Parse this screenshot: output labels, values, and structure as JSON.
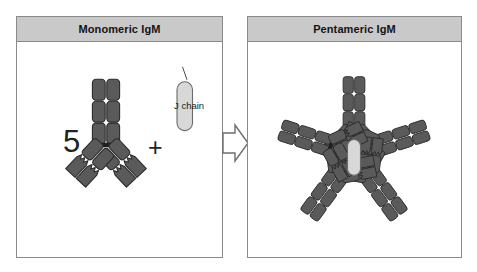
{
  "figure": {
    "background_color": "#ffffff"
  },
  "colors": {
    "panel_border": "#8a8a8a",
    "header_fill": "#c9c9c9",
    "chain_dark": "#5a5a5a",
    "chain_dark_edge": "#2b2b2b",
    "jchain_fill": "#d8d8d8",
    "hub_fill": "#ffffff",
    "arrow_fill": "#ffffff",
    "arrow_stroke": "#6d6d6d",
    "text": "#141414"
  },
  "panels": {
    "left": {
      "header": "Monomeric IgM",
      "multiplier": "5",
      "operator": "+",
      "jchain_label": "J chain",
      "icons": {
        "antibody": "antibody-monomer-icon",
        "jchain": "j-chain-capsule-icon"
      }
    },
    "right": {
      "header": "Pentameric IgM",
      "unit_count": 5,
      "icons": {
        "pentamer": "antibody-pentamer-icon",
        "hub": "pentamer-hub-icon",
        "jchain": "j-chain-capsule-icon"
      }
    }
  },
  "arrow": {
    "name": "process-arrow-icon",
    "direction": "right"
  }
}
